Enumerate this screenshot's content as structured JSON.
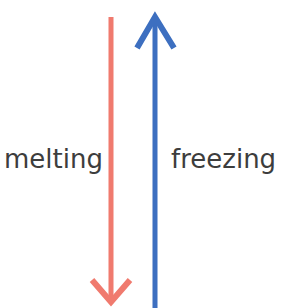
{
  "diagram": {
    "labels": {
      "melting": "melting",
      "freezing": "freezing"
    },
    "arrows": [
      {
        "name": "melting-arrow",
        "direction": "down",
        "color": "#f07a6e"
      },
      {
        "name": "freezing-arrow",
        "direction": "up",
        "color": "#3d6fc0"
      }
    ]
  }
}
